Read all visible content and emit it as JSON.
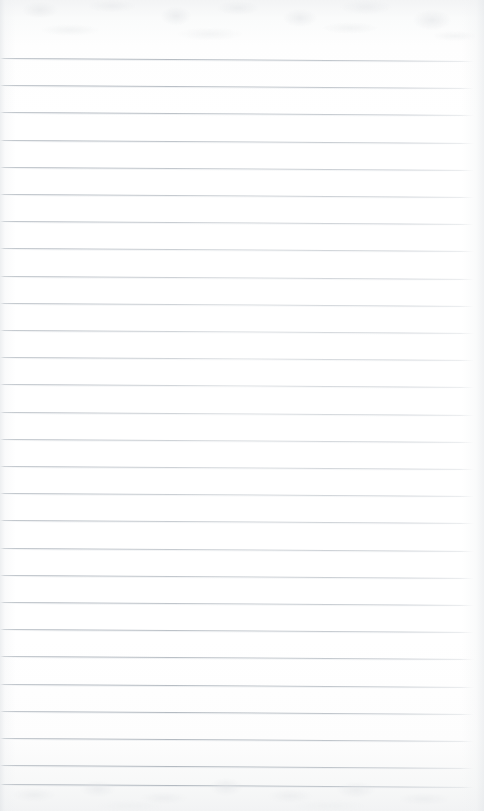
{
  "document": {
    "kind": "scanned-lined-paper",
    "title": "Blank Lined Notepad Page",
    "content_text": "",
    "page_width": 484,
    "page_height": 811
  },
  "paper": {
    "background_color": "#ffffff",
    "rule_color": "#b2b9c0",
    "rule_halo_color": "#dee2e6",
    "edge_shadow_color": "#e1e4e7",
    "texture_color": "#e4e6e8"
  },
  "ruling": {
    "line_count": 27,
    "first_line_y": 58,
    "line_spacing": 27.2,
    "line_thickness": 1,
    "left_inset": 0,
    "right_inset": 10,
    "slope_px": 3,
    "top_margin": 58,
    "bottom_margin": 27
  },
  "lines": [
    {
      "index": 1,
      "y": 58,
      "text": ""
    },
    {
      "index": 2,
      "y": 85,
      "text": ""
    },
    {
      "index": 3,
      "y": 112,
      "text": ""
    },
    {
      "index": 4,
      "y": 140,
      "text": ""
    },
    {
      "index": 5,
      "y": 167,
      "text": ""
    },
    {
      "index": 6,
      "y": 194,
      "text": ""
    },
    {
      "index": 7,
      "y": 221,
      "text": ""
    },
    {
      "index": 8,
      "y": 248,
      "text": ""
    },
    {
      "index": 9,
      "y": 276,
      "text": ""
    },
    {
      "index": 10,
      "y": 303,
      "text": ""
    },
    {
      "index": 11,
      "y": 330,
      "text": ""
    },
    {
      "index": 12,
      "y": 357,
      "text": ""
    },
    {
      "index": 13,
      "y": 384,
      "text": ""
    },
    {
      "index": 14,
      "y": 412,
      "text": ""
    },
    {
      "index": 15,
      "y": 439,
      "text": ""
    },
    {
      "index": 16,
      "y": 466,
      "text": ""
    },
    {
      "index": 17,
      "y": 493,
      "text": ""
    },
    {
      "index": 18,
      "y": 520,
      "text": ""
    },
    {
      "index": 19,
      "y": 548,
      "text": ""
    },
    {
      "index": 20,
      "y": 575,
      "text": ""
    },
    {
      "index": 21,
      "y": 602,
      "text": ""
    },
    {
      "index": 22,
      "y": 629,
      "text": ""
    },
    {
      "index": 23,
      "y": 656,
      "text": ""
    },
    {
      "index": 24,
      "y": 684,
      "text": ""
    },
    {
      "index": 25,
      "y": 711,
      "text": ""
    },
    {
      "index": 26,
      "y": 738,
      "text": ""
    },
    {
      "index": 27,
      "y": 765,
      "text": ""
    },
    {
      "index": 28,
      "y": 784,
      "text": ""
    }
  ]
}
